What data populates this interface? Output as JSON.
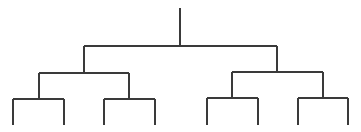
{
  "diagram": {
    "type": "binary-tree",
    "levels": 4,
    "leaf_count": 8,
    "colors": {
      "background": "#ffffff",
      "line": "#3a3a3a"
    },
    "line_width": 1.2,
    "root": {
      "x": 180,
      "top": 8,
      "split_y": 46
    },
    "level1": [
      {
        "id": "L",
        "x": 84,
        "top": 46,
        "split_y": 73
      },
      {
        "id": "R",
        "x": 277,
        "top": 46,
        "split_y": 72
      }
    ],
    "level2": [
      {
        "id": "LL",
        "x": 39,
        "top": 73,
        "split_y": 99
      },
      {
        "id": "LR",
        "x": 129,
        "top": 73,
        "split_y": 99
      },
      {
        "id": "RL",
        "x": 232,
        "top": 72,
        "split_y": 98
      },
      {
        "id": "RR",
        "x": 323,
        "top": 72,
        "split_y": 98
      }
    ],
    "leaves": [
      {
        "id": "LL1",
        "x": 13,
        "top": 99,
        "bottom": 125
      },
      {
        "id": "LL2",
        "x": 64,
        "top": 99,
        "bottom": 125
      },
      {
        "id": "LR1",
        "x": 104,
        "top": 99,
        "bottom": 125
      },
      {
        "id": "LR2",
        "x": 155,
        "top": 99,
        "bottom": 125
      },
      {
        "id": "RL1",
        "x": 207,
        "top": 98,
        "bottom": 125
      },
      {
        "id": "RL2",
        "x": 258,
        "top": 98,
        "bottom": 125
      },
      {
        "id": "RR1",
        "x": 298,
        "top": 98,
        "bottom": 125
      },
      {
        "id": "RR2",
        "x": 348,
        "top": 98,
        "bottom": 125
      }
    ]
  }
}
